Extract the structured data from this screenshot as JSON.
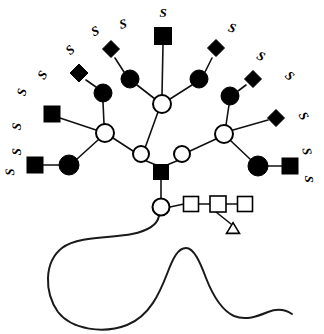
{
  "figure": {
    "domain_type": "diagram",
    "background_color": "#ffffff",
    "line_color": "#111111",
    "filled_color": "#000000",
    "open_fill": "#ffffff",
    "width": 324,
    "height": 334
  },
  "legend_symbols": [
    {
      "key": "filled-square",
      "name": "filled-square-glcnac",
      "shape": "square",
      "fill": "#000000"
    },
    {
      "key": "open-square",
      "name": "open-square-glcnac",
      "shape": "square",
      "fill": "#ffffff"
    },
    {
      "key": "filled-circle",
      "name": "filled-circle-galactose",
      "shape": "circle",
      "fill": "#000000"
    },
    {
      "key": "open-circle",
      "name": "open-circle-mannose",
      "shape": "circle",
      "fill": "#ffffff"
    },
    {
      "key": "filled-diamond",
      "name": "filled-diamond-sialic-acid",
      "shape": "diamond",
      "fill": "#000000"
    },
    {
      "key": "open-triangle",
      "name": "open-triangle-fucose",
      "shape": "triangle",
      "fill": "#ffffff"
    }
  ],
  "nodes": [
    {
      "id": "core-circle",
      "name": "core-reducing-circle",
      "shape": "circle",
      "fill": "#ffffff",
      "cx": 161,
      "cy": 207,
      "r": 8.5
    },
    {
      "id": "core-sq-1",
      "name": "core-open-square-1",
      "shape": "square",
      "fill": "#ffffff",
      "cx": 191,
      "cy": 204,
      "size": 15
    },
    {
      "id": "core-sq-2",
      "name": "core-open-square-2",
      "shape": "square",
      "fill": "#ffffff",
      "cx": 218,
      "cy": 204,
      "size": 16
    },
    {
      "id": "core-sq-3",
      "name": "core-open-square-3",
      "shape": "square",
      "fill": "#ffffff",
      "cx": 245,
      "cy": 204,
      "size": 15
    },
    {
      "id": "fucose-tri",
      "name": "open-triangle-fucose",
      "shape": "triangle",
      "fill": "#ffffff",
      "cx": 233,
      "cy": 228,
      "size": 13
    },
    {
      "id": "core-glcnac",
      "name": "core-filled-square-glcnac",
      "shape": "square",
      "fill": "#000000",
      "cx": 161,
      "cy": 172,
      "size": 15
    },
    {
      "id": "man-left",
      "name": "mannose-left-branch-circle",
      "shape": "circle",
      "fill": "#ffffff",
      "cx": 141,
      "cy": 154,
      "r": 8
    },
    {
      "id": "man-right",
      "name": "mannose-right-branch-circle",
      "shape": "circle",
      "fill": "#ffffff",
      "cx": 182,
      "cy": 154,
      "r": 8
    },
    {
      "id": "man-top",
      "name": "mannose-top-branch-circle",
      "shape": "circle",
      "fill": "#ffffff",
      "cx": 162,
      "cy": 104,
      "r": 9
    },
    {
      "id": "man-far-left",
      "name": "mannose-far-left-circle",
      "shape": "circle",
      "fill": "#ffffff",
      "cx": 105,
      "cy": 133,
      "r": 9
    },
    {
      "id": "man-far-right",
      "name": "mannose-far-right-circle",
      "shape": "circle",
      "fill": "#ffffff",
      "cx": 224,
      "cy": 134,
      "r": 9
    },
    {
      "id": "gal-t1",
      "name": "galactose-top-left-circle",
      "shape": "circle",
      "fill": "#000000",
      "cx": 130,
      "cy": 79,
      "r": 9
    },
    {
      "id": "sia-t1",
      "name": "sialic-acid-top-left-diamond",
      "shape": "diamond",
      "fill": "#000000",
      "cx": 111,
      "cy": 49,
      "size": 17
    },
    {
      "id": "glcnac-t2",
      "name": "glcnac-top-center-square",
      "shape": "square",
      "fill": "#000000",
      "cx": 163,
      "cy": 36,
      "size": 17
    },
    {
      "id": "gal-t3",
      "name": "galactose-top-right-circle",
      "shape": "circle",
      "fill": "#000000",
      "cx": 199,
      "cy": 79,
      "r": 9
    },
    {
      "id": "sia-t3",
      "name": "sialic-acid-top-right-diamond",
      "shape": "diamond",
      "fill": "#000000",
      "cx": 216,
      "cy": 48,
      "size": 17
    },
    {
      "id": "gal-l1",
      "name": "galactose-left-upper-circle",
      "shape": "circle",
      "fill": "#000000",
      "cx": 103,
      "cy": 93,
      "r": 9
    },
    {
      "id": "sia-l1",
      "name": "sialic-acid-left-upper-diamond",
      "shape": "diamond",
      "fill": "#000000",
      "cx": 79,
      "cy": 73,
      "size": 18
    },
    {
      "id": "glcnac-l2",
      "name": "glcnac-left-middle-square",
      "shape": "square",
      "fill": "#000000",
      "cx": 52,
      "cy": 114,
      "size": 16
    },
    {
      "id": "gal-l3",
      "name": "galactose-left-lower-circle",
      "shape": "circle",
      "fill": "#000000",
      "cx": 69,
      "cy": 165,
      "r": 10
    },
    {
      "id": "glcnac-l3",
      "name": "glcnac-left-lower-square",
      "shape": "square",
      "fill": "#000000",
      "cx": 35,
      "cy": 165,
      "size": 16
    },
    {
      "id": "gal-r1",
      "name": "galactose-right-upper-circle",
      "shape": "circle",
      "fill": "#000000",
      "cx": 230,
      "cy": 96,
      "r": 9
    },
    {
      "id": "sia-r1",
      "name": "sialic-acid-right-upper-diamond",
      "shape": "diamond",
      "fill": "#000000",
      "cx": 253,
      "cy": 79,
      "size": 17
    },
    {
      "id": "sia-r2",
      "name": "sialic-acid-right-middle-diamond",
      "shape": "diamond",
      "fill": "#000000",
      "cx": 276,
      "cy": 118,
      "size": 17
    },
    {
      "id": "gal-r3",
      "name": "galactose-right-lower-circle",
      "shape": "circle",
      "fill": "#000000",
      "cx": 258,
      "cy": 166,
      "r": 10
    },
    {
      "id": "glcnac-r3",
      "name": "glcnac-right-lower-square",
      "shape": "square",
      "fill": "#000000",
      "cx": 290,
      "cy": 166,
      "size": 16
    }
  ],
  "edges": [
    {
      "name": "edge-core-circle-to-sq1",
      "from": [
        170,
        207
      ],
      "to": [
        184,
        204
      ]
    },
    {
      "name": "edge-sq1-to-sq2",
      "from": [
        199,
        204
      ],
      "to": [
        210,
        204
      ]
    },
    {
      "name": "edge-sq2-to-sq3",
      "from": [
        226,
        204
      ],
      "to": [
        238,
        204
      ]
    },
    {
      "name": "edge-sq2-to-fucose",
      "from": [
        216,
        212
      ],
      "to": [
        231,
        224
      ]
    },
    {
      "name": "edge-core-circle-to-glcnac",
      "from": [
        161,
        199
      ],
      "to": [
        161,
        180
      ]
    },
    {
      "name": "edge-glcnac-to-man-left",
      "from": [
        156,
        165
      ],
      "to": [
        144,
        160
      ]
    },
    {
      "name": "edge-glcnac-to-man-right",
      "from": [
        167,
        165
      ],
      "to": [
        179,
        160
      ]
    },
    {
      "name": "edge-man-left-to-man-top",
      "from": [
        145,
        148
      ],
      "to": [
        158,
        112
      ]
    },
    {
      "name": "edge-man-left-to-man-far-left",
      "from": [
        133,
        151
      ],
      "to": [
        113,
        138
      ]
    },
    {
      "name": "edge-man-right-to-man-far-right",
      "from": [
        190,
        151
      ],
      "to": [
        216,
        139
      ]
    },
    {
      "name": "edge-man-top-to-gal-t1",
      "from": [
        155,
        99
      ],
      "to": [
        137,
        85
      ]
    },
    {
      "name": "edge-gal-t1-to-sia-t1",
      "from": [
        124,
        72
      ],
      "to": [
        115,
        58
      ]
    },
    {
      "name": "edge-man-top-to-glcnac-t2",
      "from": [
        162,
        95
      ],
      "to": [
        163,
        45
      ]
    },
    {
      "name": "edge-man-top-to-gal-t3",
      "from": [
        170,
        99
      ],
      "to": [
        192,
        85
      ]
    },
    {
      "name": "edge-gal-t3-to-sia-t3",
      "from": [
        205,
        72
      ],
      "to": [
        212,
        58
      ]
    },
    {
      "name": "edge-man-far-left-to-gal-l1",
      "from": [
        104,
        124
      ],
      "to": [
        103,
        102
      ]
    },
    {
      "name": "edge-gal-l1-to-sia-l1",
      "from": [
        96,
        87
      ],
      "to": [
        86,
        80
      ]
    },
    {
      "name": "edge-man-far-left-to-glcnac-l2",
      "from": [
        96,
        130
      ],
      "to": [
        60,
        118
      ]
    },
    {
      "name": "edge-man-far-left-to-gal-l3",
      "from": [
        98,
        140
      ],
      "to": [
        77,
        159
      ]
    },
    {
      "name": "edge-gal-l3-to-glcnac-l3",
      "from": [
        59,
        165
      ],
      "to": [
        43,
        165
      ]
    },
    {
      "name": "edge-man-far-right-to-gal-r1",
      "from": [
        226,
        125
      ],
      "to": [
        229,
        105
      ]
    },
    {
      "name": "edge-gal-r1-to-sia-r1",
      "from": [
        238,
        91
      ],
      "to": [
        246,
        85
      ]
    },
    {
      "name": "edge-man-far-right-to-sia-r2",
      "from": [
        233,
        130
      ],
      "to": [
        268,
        120
      ]
    },
    {
      "name": "edge-man-far-right-to-gal-r3",
      "from": [
        231,
        141
      ],
      "to": [
        251,
        160
      ]
    },
    {
      "name": "edge-gal-r3-to-glcnac-r3",
      "from": [
        268,
        166
      ],
      "to": [
        282,
        166
      ]
    }
  ],
  "sulfate_labels": [
    {
      "text": "S",
      "name": "sulfate-label-1",
      "x": 26,
      "y": 93,
      "rotate": -78
    },
    {
      "text": "S",
      "name": "sulfate-label-2",
      "x": 21,
      "y": 127,
      "rotate": -84
    },
    {
      "text": "S",
      "name": "sulfate-label-3",
      "x": 21,
      "y": 152,
      "rotate": -88
    },
    {
      "text": "S",
      "name": "sulfate-label-4",
      "x": 14,
      "y": 172,
      "rotate": -92
    },
    {
      "text": "S",
      "name": "sulfate-label-5",
      "x": 46,
      "y": 77,
      "rotate": -60
    },
    {
      "text": "S",
      "name": "sulfate-label-6",
      "x": 73,
      "y": 53,
      "rotate": -42
    },
    {
      "text": "S",
      "name": "sulfate-label-7",
      "x": 97,
      "y": 35,
      "rotate": -26
    },
    {
      "text": "S",
      "name": "sulfate-label-8",
      "x": 124,
      "y": 28,
      "rotate": -14
    },
    {
      "text": "S",
      "name": "sulfate-label-9",
      "x": 163,
      "y": 17,
      "rotate": 0
    },
    {
      "text": "S",
      "name": "sulfate-label-10",
      "x": 231,
      "y": 32,
      "rotate": 16
    },
    {
      "text": "S",
      "name": "sulfate-label-11",
      "x": 259,
      "y": 60,
      "rotate": 28
    },
    {
      "text": "S",
      "name": "sulfate-label-12",
      "x": 287,
      "y": 79,
      "rotate": 42
    },
    {
      "text": "S",
      "name": "sulfate-label-13",
      "x": 300,
      "y": 118,
      "rotate": 62
    },
    {
      "text": "S",
      "name": "sulfate-label-14",
      "x": 303,
      "y": 152,
      "rotate": 80
    },
    {
      "text": "S",
      "name": "sulfate-label-15",
      "x": 305,
      "y": 179,
      "rotate": 90
    }
  ],
  "backbone": {
    "name": "protein-backbone-curve",
    "description": "wavy peptide backbone chain extending from the reducing-end circle",
    "path": "M159,216 C157,226 147,231 132,234 C112,238 78,236 62,248 C44,262 44,292 58,312 C72,330 104,334 127,325 C150,316 160,292 167,274 C173,258 178,248 186,248 C194,248 200,262 206,278 C213,296 221,310 234,316 C246,321 258,316 268,312 C278,308 286,310 292,314"
  }
}
